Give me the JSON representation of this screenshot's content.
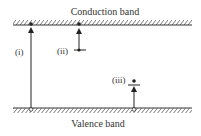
{
  "diagram": {
    "conduction_band_label": "Conduction band",
    "valence_band_label": "Valence band",
    "transitions": [
      {
        "id": "i",
        "label": "(i)",
        "description": "Valence band to conduction band"
      },
      {
        "id": "ii",
        "label": "(ii)",
        "description": "Donor level to conduction band"
      },
      {
        "id": "iii",
        "label": "(iii)",
        "description": "Valence band to acceptor level"
      }
    ],
    "colors": {
      "line": "#333333",
      "background": "#ffffff"
    }
  }
}
